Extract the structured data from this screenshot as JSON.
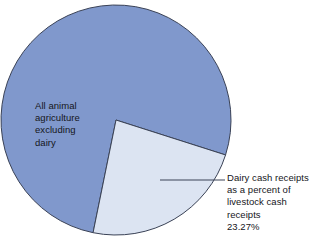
{
  "chart_data": {
    "type": "pie",
    "title": "",
    "subtitle": "",
    "xlabel": "",
    "ylabel": "",
    "legend_position": "callout-labels",
    "grid": false,
    "units": "percent",
    "total": 100,
    "categories": [
      "All animal agriculture excluding dairy",
      "Dairy cash receipts as a percent of livestock cash receipts"
    ],
    "values": [
      76.73,
      23.27
    ],
    "colors": [
      "#8098cc",
      "#dce4f2"
    ],
    "start_angle_deg": 17.7,
    "direction": "clockwise",
    "slices": [
      {
        "name": "all-animal-agriculture-excluding-dairy",
        "value": 76.73,
        "color": "#8098cc",
        "sweep_deg": 276.2
      },
      {
        "name": "dairy-cash-receipts",
        "value": 23.27,
        "color": "#dce4f2",
        "sweep_deg": 83.8
      }
    ]
  },
  "geometry": {
    "center_x": 116,
    "center_y": 120,
    "radius": 115,
    "stroke_color": "#3a4256",
    "stroke_width": 1,
    "background": "#ffffff"
  },
  "labels": {
    "major": {
      "lines": [
        "All animal",
        "agriculture",
        "excluding",
        "dairy"
      ]
    },
    "minor": {
      "lines": [
        "Dairy cash receipts",
        "as a percent of",
        "livestock cash",
        "receipts",
        "23.27%"
      ],
      "value_text": "23.27%"
    }
  },
  "leader_line": {
    "x1": 160,
    "y1": 180,
    "x2": 225,
    "y2": 180,
    "color": "#3a4256"
  }
}
